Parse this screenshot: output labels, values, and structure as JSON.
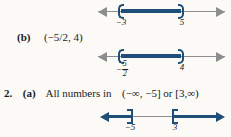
{
  "document": {
    "background_color": "#fbfaf7",
    "ink_color": "#1a1a1a",
    "accent_color": "#1f4e79",
    "axis_color": "#8d8d8f"
  },
  "answers": {
    "item_1b": {
      "number_label": "(b)",
      "interval_text": "(−5/2, 4)"
    },
    "item_2a": {
      "number_label": "2.",
      "part_label": "(a)",
      "body_text": "All numbers in",
      "interval_text": "(−∞, −5] or [3,∞)"
    }
  },
  "number_lines": [
    {
      "id": "numline-1",
      "type": "bounded-open-interval",
      "left_tick_label": "−3",
      "right_tick_label": "5",
      "left_endpoint_style": "open-paren",
      "right_endpoint_style": "open-paren",
      "left_arrow": "gray",
      "right_arrow": "gray"
    },
    {
      "id": "numline-2",
      "type": "bounded-open-interval",
      "left_tick_label_numerator": "5",
      "left_tick_label_denominator": "2",
      "left_tick_label_sign": "−",
      "right_tick_label": "4",
      "left_endpoint_style": "open-paren",
      "right_endpoint_style": "open-paren",
      "left_arrow": "gray",
      "right_arrow": "gray"
    },
    {
      "id": "numline-3",
      "type": "union-of-two-rays",
      "left_tick_label": "−5",
      "right_tick_label": "3",
      "left_endpoint_style": "closed-bracket-right",
      "right_endpoint_style": "closed-bracket-left",
      "left_arrow": "blue",
      "right_arrow": "blue"
    }
  ]
}
